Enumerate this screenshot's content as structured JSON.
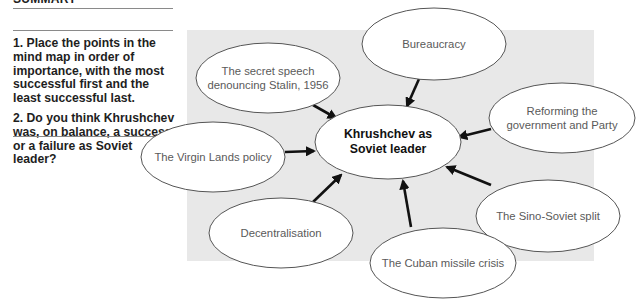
{
  "sidebar": {
    "heading": "SUMMARY",
    "questions": [
      "1. Place the points in the mind map in order of importance, with the most successful first and the least successful last.",
      "2. Do you think Khrushchev was, on balance, a success or a failure as Soviet leader?"
    ]
  },
  "mind_map": {
    "background_color": "#e8e8e8",
    "center": {
      "label": "Khrushchev as Soviet leader",
      "cx": 388,
      "cy": 142,
      "rx": 73,
      "ry": 37
    },
    "nodes": [
      {
        "id": "bureaucracy",
        "label": "Bureaucracy",
        "cx": 434,
        "cy": 44,
        "rx": 72,
        "ry": 36,
        "arrow": [
          419,
          79,
          407,
          106
        ]
      },
      {
        "id": "secret-speech",
        "label": "The secret speech denouncing Stalin, 1956",
        "cx": 268,
        "cy": 78,
        "rx": 72,
        "ry": 35,
        "arrow": [
          313,
          105,
          336,
          118
        ]
      },
      {
        "id": "reforming",
        "label": "Reforming the government and Party",
        "cx": 562,
        "cy": 118,
        "rx": 73,
        "ry": 35,
        "arrow": [
          491,
          129,
          459,
          137
        ]
      },
      {
        "id": "virgin-lands",
        "label": "The Virgin Lands policy",
        "cx": 213,
        "cy": 157,
        "rx": 72,
        "ry": 35,
        "arrow": [
          285,
          152,
          314,
          151
        ]
      },
      {
        "id": "sino-soviet",
        "label": "The Sino-Soviet split",
        "cx": 548,
        "cy": 216,
        "rx": 72,
        "ry": 36,
        "arrow": [
          491,
          185,
          447,
          167
        ]
      },
      {
        "id": "decentralisation",
        "label": "Decentralisation",
        "cx": 281,
        "cy": 233,
        "rx": 72,
        "ry": 35,
        "arrow": [
          313,
          202,
          341,
          175
        ]
      },
      {
        "id": "cuban-missile",
        "label": "The Cuban missile crisis",
        "cx": 443,
        "cy": 263,
        "rx": 73,
        "ry": 35,
        "arrow": [
          411,
          227,
          403,
          181
        ]
      }
    ]
  }
}
